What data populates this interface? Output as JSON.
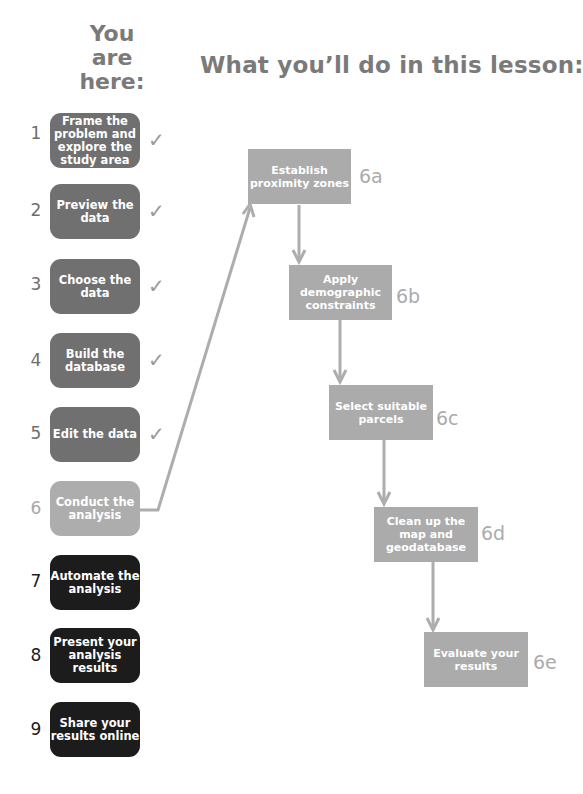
{
  "you_are_here": [
    "You",
    "are",
    "here:"
  ],
  "lesson_title": "What you’ll do in this lesson:",
  "steps": [
    {
      "number": "1",
      "label": "Frame the problem and explore the study area",
      "status": "done"
    },
    {
      "number": "2",
      "label": "Preview the data",
      "status": "done"
    },
    {
      "number": "3",
      "label": "Choose the data",
      "status": "done"
    },
    {
      "number": "4",
      "label": "Build the database",
      "status": "done"
    },
    {
      "number": "5",
      "label": "Edit the data",
      "status": "done"
    },
    {
      "number": "6",
      "label": "Conduct the analysis",
      "status": "current"
    },
    {
      "number": "7",
      "label": "Automate the analysis",
      "status": "todo"
    },
    {
      "number": "8",
      "label": "Present your analysis results",
      "status": "todo"
    },
    {
      "number": "9",
      "label": "Share your results online",
      "status": "todo"
    }
  ],
  "check_glyph": "✓",
  "substeps": [
    {
      "id": "6a",
      "label": "Establish proximity zones"
    },
    {
      "id": "6b",
      "label": "Apply demographic constraints"
    },
    {
      "id": "6c",
      "label": "Select suitable parcels"
    },
    {
      "id": "6d",
      "label": "Clean up the map and geodatabase"
    },
    {
      "id": "6e",
      "label": "Evaluate your results"
    }
  ],
  "colors": {
    "done": "#707070",
    "current": "#adadad",
    "todo": "#1c1c1c",
    "connector": "#adadad",
    "heading": "#7a7a7a"
  }
}
